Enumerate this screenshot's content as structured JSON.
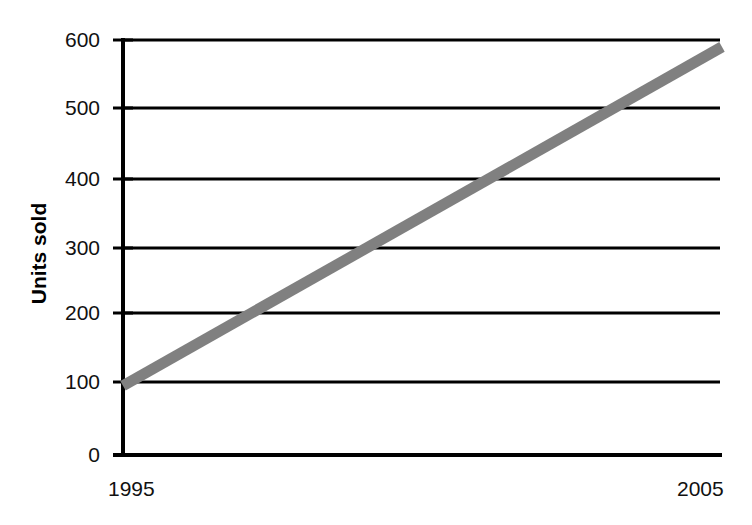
{
  "chart_data": {
    "type": "line",
    "title": "",
    "subtitle": "",
    "xlabel": "",
    "ylabel": "Units sold",
    "x": [
      1995,
      2005
    ],
    "values": [
      100,
      590
    ],
    "series": [
      {
        "name": "Units sold",
        "x": [
          1995,
          2005
        ],
        "values": [
          100,
          590
        ],
        "color": "#808080",
        "line_width_px": 11
      }
    ],
    "xlim": [
      1995,
      2005
    ],
    "ylim": [
      0,
      600
    ],
    "xticks": [
      1995,
      2005
    ],
    "xtick_labels": [
      "1995",
      "2005"
    ],
    "yticks": [
      0,
      100,
      200,
      300,
      400,
      500,
      600
    ],
    "ytick_labels": [
      "0",
      "100",
      "200",
      "300",
      "400",
      "500",
      "600"
    ],
    "grid": "horizontal",
    "grid_color": "#000000",
    "axis_color": "#000000",
    "legend": "none",
    "legend_position": "none",
    "annotations": []
  },
  "axes": {
    "y_label_text": "Units sold",
    "y_ticks": [
      {
        "label": "600",
        "value": 600
      },
      {
        "label": "500",
        "value": 500
      },
      {
        "label": "400",
        "value": 400
      },
      {
        "label": "300",
        "value": 300
      },
      {
        "label": "200",
        "value": 200
      },
      {
        "label": "100",
        "value": 100
      },
      {
        "label": "0",
        "value": 0
      }
    ],
    "x_ticks": [
      {
        "label": "1995",
        "value": 1995
      },
      {
        "label": "2005",
        "value": 2005
      }
    ]
  },
  "colors": {
    "series_gray": "#808080",
    "axis_black": "#000000",
    "background": "#ffffff"
  }
}
